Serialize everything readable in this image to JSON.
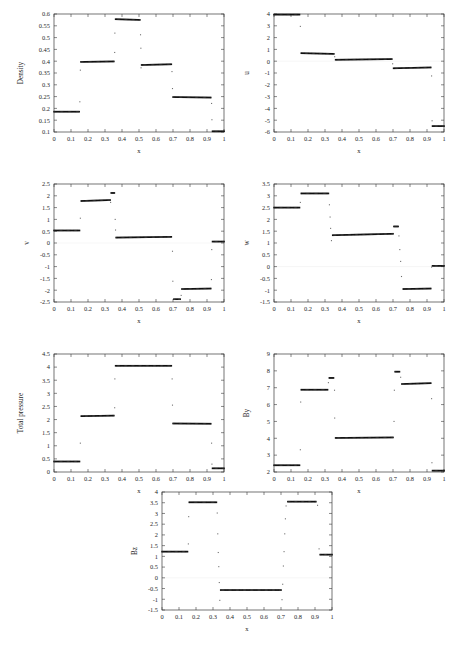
{
  "figure": {
    "title": "",
    "shared_xlabel": "x",
    "panel_count": 7
  },
  "chart_data": [
    {
      "type": "scatter",
      "name": "density",
      "title": "",
      "xlabel": "x",
      "ylabel": "Density",
      "xlim": [
        0,
        1
      ],
      "ylim": [
        0.1,
        0.6
      ],
      "xticks": [
        0,
        0.1,
        0.2,
        0.3,
        0.4,
        0.5,
        0.6,
        0.7,
        0.8,
        0.9,
        1
      ],
      "xticklabels": [
        "0",
        "0.1",
        "0.2",
        "0.3",
        "0.4",
        "0.5",
        "0.6",
        "0.7",
        "0.8",
        "0.9",
        "1"
      ],
      "yticks": [
        0.1,
        0.15,
        0.2,
        0.25,
        0.3,
        0.35,
        0.4,
        0.45,
        0.5,
        0.55,
        0.6
      ],
      "yticklabels": [
        "0.1",
        "0.15",
        "0.2",
        "0.25",
        "0.3",
        "0.35",
        "0.4",
        "0.45",
        "0.5",
        "0.55",
        "0.6"
      ],
      "grid": false,
      "legend": "none",
      "segments": [
        {
          "x0": 0.0,
          "x1": 0.148,
          "y0": 0.186,
          "y1": 0.186
        },
        {
          "x0": 0.158,
          "x1": 0.352,
          "y0": 0.397,
          "y1": 0.399
        },
        {
          "x0": 0.362,
          "x1": 0.505,
          "y0": 0.578,
          "y1": 0.575
        },
        {
          "x0": 0.515,
          "x1": 0.69,
          "y0": 0.384,
          "y1": 0.387
        },
        {
          "x0": 0.7,
          "x1": 0.922,
          "y0": 0.248,
          "y1": 0.246
        },
        {
          "x0": 0.932,
          "x1": 1.0,
          "y0": 0.103,
          "y1": 0.103
        }
      ],
      "transition_points": [
        {
          "x": 0.152,
          "y": 0.228
        },
        {
          "x": 0.155,
          "y": 0.362
        },
        {
          "x": 0.357,
          "y": 0.437
        },
        {
          "x": 0.358,
          "y": 0.519
        },
        {
          "x": 0.509,
          "y": 0.512
        },
        {
          "x": 0.511,
          "y": 0.455
        },
        {
          "x": 0.512,
          "y": 0.372
        },
        {
          "x": 0.694,
          "y": 0.356
        },
        {
          "x": 0.697,
          "y": 0.284
        },
        {
          "x": 0.927,
          "y": 0.221
        },
        {
          "x": 0.929,
          "y": 0.152
        }
      ]
    },
    {
      "type": "scatter",
      "name": "u",
      "title": "",
      "xlabel": "x",
      "ylabel": "u",
      "xlim": [
        0,
        1
      ],
      "ylim": [
        -6,
        4
      ],
      "xticks": [
        0,
        0.1,
        0.2,
        0.3,
        0.4,
        0.5,
        0.6,
        0.7,
        0.8,
        0.9,
        1
      ],
      "xticklabels": [
        "0",
        "0.1",
        "0.2",
        "0.3",
        "0.4",
        "0.5",
        "0.6",
        "0.7",
        "0.8",
        "0.9",
        "1"
      ],
      "yticks": [
        -6,
        -5,
        -4,
        -3,
        -2,
        -1,
        0,
        1,
        2,
        3,
        4
      ],
      "yticklabels": [
        "-6",
        "-5",
        "-4",
        "-3",
        "-2",
        "-1",
        "0",
        "1",
        "2",
        "3",
        "4"
      ],
      "grid": false,
      "legend": "none",
      "segments": [
        {
          "x0": 0.0,
          "x1": 0.15,
          "y0": 3.95,
          "y1": 3.95
        },
        {
          "x0": 0.16,
          "x1": 0.352,
          "y0": 0.68,
          "y1": 0.62
        },
        {
          "x0": 0.362,
          "x1": 0.693,
          "y0": 0.12,
          "y1": 0.18
        },
        {
          "x0": 0.703,
          "x1": 0.922,
          "y0": -0.6,
          "y1": -0.53
        },
        {
          "x0": 0.932,
          "x1": 1.0,
          "y0": -5.5,
          "y1": -5.5
        }
      ],
      "transition_points": [
        {
          "x": 0.155,
          "y": 2.95
        },
        {
          "x": 0.357,
          "y": 0.38
        },
        {
          "x": 0.698,
          "y": -0.22
        },
        {
          "x": 0.927,
          "y": -1.25
        },
        {
          "x": 0.93,
          "y": -5.05
        }
      ]
    },
    {
      "type": "scatter",
      "name": "v",
      "title": "",
      "xlabel": "x",
      "ylabel": "v",
      "xlim": [
        0,
        1
      ],
      "ylim": [
        -2.5,
        2.5
      ],
      "xticks": [
        0,
        0.1,
        0.2,
        0.3,
        0.4,
        0.5,
        0.6,
        0.7,
        0.8,
        0.9,
        1
      ],
      "xticklabels": [
        "0",
        "0.1",
        "0.2",
        "0.3",
        "0.4",
        "0.5",
        "0.6",
        "0.7",
        "0.8",
        "0.9",
        "1"
      ],
      "yticks": [
        -2.5,
        -2,
        -1.5,
        -1,
        -0.5,
        0,
        0.5,
        1,
        1.5,
        2,
        2.5
      ],
      "yticklabels": [
        "-2.5",
        "-2",
        "-1.5",
        "-1",
        "-0.5",
        "0",
        "0.5",
        "1",
        "1.5",
        "2",
        "2.5"
      ],
      "grid": false,
      "legend": "none",
      "segments": [
        {
          "x0": 0.0,
          "x1": 0.15,
          "y0": 0.53,
          "y1": 0.53
        },
        {
          "x0": 0.16,
          "x1": 0.33,
          "y0": 1.78,
          "y1": 1.82
        },
        {
          "x0": 0.336,
          "x1": 0.355,
          "y0": 2.12,
          "y1": 2.12
        },
        {
          "x0": 0.365,
          "x1": 0.69,
          "y0": 0.23,
          "y1": 0.26
        },
        {
          "x0": 0.705,
          "x1": 0.742,
          "y0": -2.38,
          "y1": -2.38
        },
        {
          "x0": 0.752,
          "x1": 0.922,
          "y0": -1.95,
          "y1": -1.93
        },
        {
          "x0": 0.932,
          "x1": 1.0,
          "y0": 0.06,
          "y1": 0.06
        }
      ],
      "transition_points": [
        {
          "x": 0.155,
          "y": 1.05
        },
        {
          "x": 0.333,
          "y": 1.72
        },
        {
          "x": 0.36,
          "y": 1.0
        },
        {
          "x": 0.362,
          "y": 0.55
        },
        {
          "x": 0.697,
          "y": -0.35
        },
        {
          "x": 0.699,
          "y": -1.62
        },
        {
          "x": 0.748,
          "y": -2.22
        },
        {
          "x": 0.926,
          "y": -1.55
        },
        {
          "x": 0.928,
          "y": -0.28
        }
      ]
    },
    {
      "type": "scatter",
      "name": "w",
      "title": "",
      "xlabel": "x",
      "ylabel": "w",
      "xlim": [
        0,
        1
      ],
      "ylim": [
        -1.5,
        3.5
      ],
      "xticks": [
        0,
        0.1,
        0.2,
        0.3,
        0.4,
        0.5,
        0.6,
        0.7,
        0.8,
        0.9,
        1
      ],
      "xticklabels": [
        "0",
        "0.1",
        "0.2",
        "0.3",
        "0.4",
        "0.5",
        "0.6",
        "0.7",
        "0.8",
        "0.9",
        "1"
      ],
      "yticks": [
        -1.5,
        -1,
        -0.5,
        0,
        0.5,
        1,
        1.5,
        2,
        2.5,
        3,
        3.5
      ],
      "yticklabels": [
        "-1.5",
        "-1",
        "-0.5",
        "0",
        "0.5",
        "1",
        "1.5",
        "2",
        "2.5",
        "3",
        "3.5"
      ],
      "grid": false,
      "legend": "none",
      "segments": [
        {
          "x0": 0.0,
          "x1": 0.15,
          "y0": 2.5,
          "y1": 2.5
        },
        {
          "x0": 0.16,
          "x1": 0.32,
          "y0": 3.1,
          "y1": 3.1
        },
        {
          "x0": 0.345,
          "x1": 0.7,
          "y0": 1.33,
          "y1": 1.39
        },
        {
          "x0": 0.705,
          "x1": 0.73,
          "y0": 1.7,
          "y1": 1.7
        },
        {
          "x0": 0.76,
          "x1": 0.922,
          "y0": -0.95,
          "y1": -0.93
        },
        {
          "x0": 0.932,
          "x1": 1.0,
          "y0": 0.03,
          "y1": 0.03
        }
      ],
      "transition_points": [
        {
          "x": 0.155,
          "y": 2.72
        },
        {
          "x": 0.326,
          "y": 2.62
        },
        {
          "x": 0.33,
          "y": 2.1
        },
        {
          "x": 0.333,
          "y": 1.62
        },
        {
          "x": 0.338,
          "y": 1.1
        },
        {
          "x": 0.735,
          "y": 1.3
        },
        {
          "x": 0.74,
          "y": 0.72
        },
        {
          "x": 0.745,
          "y": 0.22
        },
        {
          "x": 0.75,
          "y": -0.42
        },
        {
          "x": 0.927,
          "y": -0.02
        }
      ]
    },
    {
      "type": "scatter",
      "name": "total_pressure",
      "title": "",
      "xlabel": "x",
      "ylabel": "Total pressure",
      "xlim": [
        0,
        1
      ],
      "ylim": [
        0,
        4.5
      ],
      "xticks": [
        0,
        0.1,
        0.2,
        0.3,
        0.4,
        0.5,
        0.6,
        0.7,
        0.8,
        0.9,
        1
      ],
      "xticklabels": [
        "0",
        "0.1",
        "0.2",
        "0.3",
        "0.4",
        "0.5",
        "0.6",
        "0.7",
        "0.8",
        "0.9",
        "1"
      ],
      "yticks": [
        0,
        0.5,
        1,
        1.5,
        2,
        2.5,
        3,
        3.5,
        4,
        4.5
      ],
      "yticklabels": [
        "0",
        "0.5",
        "1",
        "1.5",
        "2",
        "2.5",
        "3",
        "3.5",
        "4",
        "4.5"
      ],
      "grid": false,
      "legend": "none",
      "segments": [
        {
          "x0": 0.0,
          "x1": 0.15,
          "y0": 0.4,
          "y1": 0.4
        },
        {
          "x0": 0.16,
          "x1": 0.352,
          "y0": 2.13,
          "y1": 2.15
        },
        {
          "x0": 0.362,
          "x1": 0.69,
          "y0": 4.05,
          "y1": 4.05
        },
        {
          "x0": 0.7,
          "x1": 0.922,
          "y0": 1.85,
          "y1": 1.84
        },
        {
          "x0": 0.932,
          "x1": 1.0,
          "y0": 0.14,
          "y1": 0.14
        }
      ],
      "transition_points": [
        {
          "x": 0.155,
          "y": 1.1
        },
        {
          "x": 0.357,
          "y": 2.45
        },
        {
          "x": 0.358,
          "y": 3.55
        },
        {
          "x": 0.695,
          "y": 3.55
        },
        {
          "x": 0.697,
          "y": 2.55
        },
        {
          "x": 0.927,
          "y": 1.1
        },
        {
          "x": 0.929,
          "y": 0.3
        }
      ]
    },
    {
      "type": "scatter",
      "name": "By",
      "title": "",
      "xlabel": "x",
      "ylabel": "By",
      "xlim": [
        0,
        1
      ],
      "ylim": [
        2,
        9
      ],
      "xticks": [
        0,
        0.1,
        0.2,
        0.3,
        0.4,
        0.5,
        0.6,
        0.7,
        0.8,
        0.9,
        1
      ],
      "xticklabels": [
        "0",
        "0.1",
        "0.2",
        "0.3",
        "0.4",
        "0.5",
        "0.6",
        "0.7",
        "0.8",
        "0.9",
        "1"
      ],
      "yticks": [
        2,
        3,
        4,
        5,
        6,
        7,
        8,
        9
      ],
      "yticklabels": [
        "2",
        "3",
        "4",
        "5",
        "6",
        "7",
        "8",
        "9"
      ],
      "grid": false,
      "legend": "none",
      "segments": [
        {
          "x0": 0.0,
          "x1": 0.15,
          "y0": 2.4,
          "y1": 2.4
        },
        {
          "x0": 0.16,
          "x1": 0.315,
          "y0": 6.88,
          "y1": 6.88
        },
        {
          "x0": 0.325,
          "x1": 0.35,
          "y0": 7.58,
          "y1": 7.58
        },
        {
          "x0": 0.362,
          "x1": 0.7,
          "y0": 4.02,
          "y1": 4.05
        },
        {
          "x0": 0.712,
          "x1": 0.738,
          "y0": 7.95,
          "y1": 7.95
        },
        {
          "x0": 0.752,
          "x1": 0.922,
          "y0": 7.22,
          "y1": 7.27
        },
        {
          "x0": 0.932,
          "x1": 1.0,
          "y0": 2.08,
          "y1": 2.08
        }
      ],
      "transition_points": [
        {
          "x": 0.155,
          "y": 3.32
        },
        {
          "x": 0.157,
          "y": 6.15
        },
        {
          "x": 0.32,
          "y": 7.3
        },
        {
          "x": 0.356,
          "y": 6.85
        },
        {
          "x": 0.357,
          "y": 5.2
        },
        {
          "x": 0.706,
          "y": 5.0
        },
        {
          "x": 0.708,
          "y": 6.85
        },
        {
          "x": 0.745,
          "y": 7.62
        },
        {
          "x": 0.927,
          "y": 6.35
        },
        {
          "x": 0.929,
          "y": 2.55
        }
      ]
    },
    {
      "type": "scatter",
      "name": "Bz",
      "title": "",
      "xlabel": "x",
      "ylabel": "Bz",
      "xlim": [
        0,
        1
      ],
      "ylim": [
        -1.5,
        4
      ],
      "xticks": [
        0,
        0.1,
        0.2,
        0.3,
        0.4,
        0.5,
        0.6,
        0.7,
        0.8,
        0.9,
        1
      ],
      "xticklabels": [
        "0",
        "0.1",
        "0.2",
        "0.3",
        "0.4",
        "0.5",
        "0.6",
        "0.7",
        "0.8",
        "0.9",
        "1"
      ],
      "yticks": [
        -1.5,
        -1,
        -0.5,
        0,
        0.5,
        1,
        1.5,
        2,
        2.5,
        3,
        3.5,
        4
      ],
      "yticklabels": [
        "-1.5",
        "-1",
        "-0.5",
        "0",
        "0.5",
        "1",
        "1.5",
        "2",
        "2.5",
        "3",
        "3.5",
        "4"
      ],
      "grid": false,
      "legend": "none",
      "segments": [
        {
          "x0": 0.0,
          "x1": 0.15,
          "y0": 1.22,
          "y1": 1.22
        },
        {
          "x0": 0.16,
          "x1": 0.32,
          "y0": 3.52,
          "y1": 3.52
        },
        {
          "x0": 0.345,
          "x1": 0.7,
          "y0": -0.57,
          "y1": -0.57
        },
        {
          "x0": 0.74,
          "x1": 0.905,
          "y0": 3.55,
          "y1": 3.55
        },
        {
          "x0": 0.93,
          "x1": 1.0,
          "y0": 1.08,
          "y1": 1.08
        }
      ],
      "transition_points": [
        {
          "x": 0.155,
          "y": 1.58
        },
        {
          "x": 0.157,
          "y": 2.85
        },
        {
          "x": 0.325,
          "y": 3.02
        },
        {
          "x": 0.328,
          "y": 2.05
        },
        {
          "x": 0.331,
          "y": 1.18
        },
        {
          "x": 0.334,
          "y": 0.52
        },
        {
          "x": 0.337,
          "y": -0.22
        },
        {
          "x": 0.34,
          "y": -1.05
        },
        {
          "x": 0.706,
          "y": -1.02
        },
        {
          "x": 0.71,
          "y": -0.3
        },
        {
          "x": 0.714,
          "y": 0.55
        },
        {
          "x": 0.718,
          "y": 1.22
        },
        {
          "x": 0.722,
          "y": 2.05
        },
        {
          "x": 0.726,
          "y": 2.75
        },
        {
          "x": 0.73,
          "y": 3.35
        },
        {
          "x": 0.915,
          "y": 3.38
        },
        {
          "x": 0.924,
          "y": 1.35
        }
      ]
    }
  ]
}
